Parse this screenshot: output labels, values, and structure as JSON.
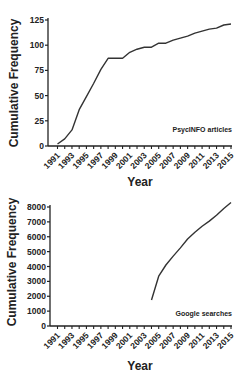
{
  "chart_data": [
    {
      "type": "line",
      "title": "",
      "xlabel": "Year",
      "ylabel": "Cumulative  Frequency",
      "annotation": "PsycINFO articles",
      "x": [
        1991,
        1992,
        1993,
        1994,
        1995,
        1996,
        1997,
        1998,
        1999,
        2000,
        2001,
        2002,
        2003,
        2004,
        2005,
        2006,
        2007,
        2008,
        2009,
        2010,
        2011,
        2012,
        2013,
        2014,
        2015
      ],
      "values": [
        2,
        7,
        16,
        36,
        49,
        62,
        76,
        87,
        87,
        87,
        93,
        96,
        98,
        98,
        102,
        102,
        105,
        107,
        109,
        112,
        114,
        116,
        117,
        120,
        121
      ],
      "x_ticks": [
        "1991",
        "1993",
        "1995",
        "1997",
        "1999",
        "2001",
        "2003",
        "2005",
        "2007",
        "2009",
        "2011",
        "2013",
        "2015"
      ],
      "y_ticks": [
        "0",
        "25",
        "50",
        "75",
        "100",
        "125"
      ],
      "ylim": [
        0,
        125
      ],
      "grid": false,
      "legend": null
    },
    {
      "type": "line",
      "title": "",
      "xlabel": "Year",
      "ylabel": "Cumulative  Frequency",
      "annotation": "Google  searches",
      "x": [
        2004,
        2005,
        2006,
        2007,
        2008,
        2009,
        2010,
        2011,
        2012,
        2013,
        2014,
        2015
      ],
      "values": [
        1750,
        3350,
        4100,
        4700,
        5250,
        5850,
        6300,
        6700,
        7050,
        7450,
        7900,
        8300
      ],
      "x_ticks": [
        "1991",
        "1993",
        "1995",
        "1997",
        "1999",
        "2001",
        "2003",
        "2005",
        "2007",
        "2009",
        "2011",
        "2013",
        "2015"
      ],
      "y_ticks": [
        "0",
        "1000",
        "2000",
        "3000",
        "4000",
        "5000",
        "6000",
        "7000",
        "8000"
      ],
      "ylim": [
        0,
        8500
      ],
      "grid": false,
      "legend": null
    }
  ],
  "style": {
    "line_color": "#333333",
    "axis_color": "#222222"
  }
}
